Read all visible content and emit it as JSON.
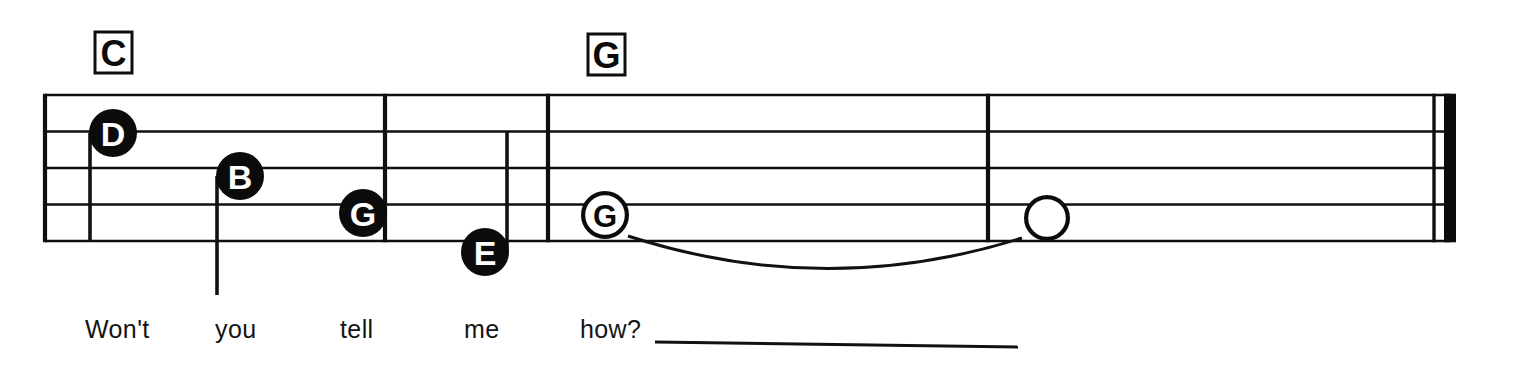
{
  "sheet": {
    "title": "Melody staff excerpt with chord symbols and lyrics",
    "background_color": "#ffffff",
    "ink_color": "#0b0b0b",
    "width": 1523,
    "height": 365
  },
  "staff": {
    "name": "five-line-staff",
    "line_count": 5,
    "left_x": 45,
    "right_x": 1450,
    "line_y": [
      95,
      131.5,
      168,
      204.5,
      241
    ],
    "line_spacing": 36.5
  },
  "chord_symbols": [
    {
      "label": "C",
      "x": 95,
      "y": 32,
      "width": 37,
      "height": 41
    },
    {
      "label": "G",
      "x": 588,
      "y": 34,
      "width": 37,
      "height": 41
    }
  ],
  "barlines": [
    {
      "name": "barline-start",
      "x": 45,
      "type": "thin-full",
      "full": true
    },
    {
      "name": "barline-1",
      "x": 385,
      "type": "thin-full",
      "full": true
    },
    {
      "name": "barline-2",
      "x": 548,
      "type": "thin-full",
      "full": true
    },
    {
      "name": "barline-3",
      "x": 988,
      "type": "thin-full",
      "full": true
    },
    {
      "name": "final-barline-thin",
      "x": 1434,
      "type": "thin",
      "full": true
    },
    {
      "name": "final-barline-thick",
      "x": 1444,
      "type": "thick",
      "full": true
    }
  ],
  "notes": [
    {
      "id": "note-d",
      "label": "D",
      "filled": true,
      "cx": 113,
      "cy": 133,
      "r": 24,
      "stem": {
        "direction": "down",
        "x": 90,
        "y_top": 133,
        "y_bottom": 242
      }
    },
    {
      "id": "note-b",
      "label": "B",
      "filled": true,
      "cx": 240,
      "cy": 176,
      "r": 24,
      "stem": {
        "direction": "down",
        "x": 217,
        "y_top": 176,
        "y_bottom": 295
      }
    },
    {
      "id": "note-g-filled",
      "label": "G",
      "filled": true,
      "cx": 363,
      "cy": 213,
      "r": 24,
      "stem": {
        "direction": "up",
        "x": 385,
        "y_top": 95,
        "y_bottom": 213
      }
    },
    {
      "id": "note-e",
      "label": "E",
      "filled": true,
      "cx": 485,
      "cy": 252,
      "r": 24,
      "stem": {
        "direction": "up",
        "x": 507,
        "y_top": 131,
        "y_bottom": 252
      }
    },
    {
      "id": "note-g-hollow",
      "label": "G",
      "filled": false,
      "cx": 605,
      "cy": 215,
      "r": 24,
      "stem": null
    },
    {
      "id": "note-blank-hollow",
      "label": "",
      "filled": false,
      "cx": 1047,
      "cy": 218,
      "r": 23,
      "stem": null
    }
  ],
  "tie": {
    "name": "tie-slur",
    "from_note": "note-g-hollow",
    "to_note": "note-blank-hollow",
    "start_x": 628,
    "start_y": 236,
    "end_x": 1022,
    "end_y": 238,
    "control_x": 825,
    "control_y": 300
  },
  "lyrics": {
    "baseline_y": 338,
    "syllables": [
      {
        "text": "Won't",
        "x": 85
      },
      {
        "text": "you",
        "x": 215
      },
      {
        "text": "tell",
        "x": 340
      },
      {
        "text": "me",
        "x": 464
      },
      {
        "text": "how?",
        "x": 580
      }
    ],
    "extension_line": {
      "x_start": 655,
      "y_start": 342,
      "x_end": 1018,
      "y_end": 347
    }
  }
}
